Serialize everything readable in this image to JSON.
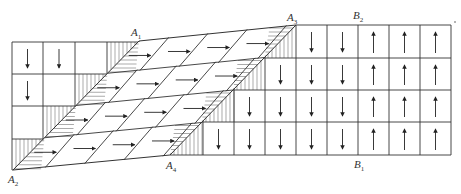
{
  "diagram": {
    "type": "domain-shear-grid",
    "caption_faded": "",
    "line_color": "#333333",
    "hatch_color": "#555555",
    "labels": [
      {
        "id": "A1",
        "base": "A",
        "sub": "1",
        "x": 131,
        "y": 36
      },
      {
        "id": "A2",
        "base": "A",
        "sub": "2",
        "x": 8,
        "y": 183
      },
      {
        "id": "A3",
        "base": "A",
        "sub": "3",
        "x": 287,
        "y": 21
      },
      {
        "id": "A4",
        "base": "A",
        "sub": "4",
        "x": 166,
        "y": 169
      },
      {
        "id": "B1",
        "base": "B",
        "sub": "1",
        "x": 354,
        "y": 168
      },
      {
        "id": "B2",
        "base": "B",
        "sub": "2",
        "x": 353,
        "y": 19
      }
    ],
    "points": {
      "A1": [
        139,
        41
      ],
      "A2": [
        13,
        170
      ],
      "A3": [
        296,
        25
      ],
      "A4": [
        170,
        155
      ]
    },
    "left_grid": {
      "cols_x": [
        12,
        43,
        75,
        107,
        139
      ],
      "rows_y": [
        42,
        74,
        106,
        139,
        170
      ],
      "arrow": "down"
    },
    "right_grid": {
      "cols_x": [
        170,
        203,
        234,
        265,
        296,
        327,
        358,
        389,
        420,
        451
      ],
      "rows_y": [
        25,
        58,
        90,
        122,
        155
      ],
      "arrows": [
        "down",
        "down",
        "down",
        "down",
        "down",
        "down",
        "up",
        "up",
        "up"
      ]
    },
    "middle_region": {
      "arrow": "right",
      "rows": 4,
      "cols": 4
    }
  }
}
